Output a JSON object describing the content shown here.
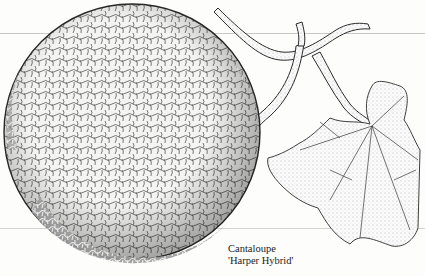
{
  "illustration": {
    "subject": "cantaloupe-with-vine-and-leaf",
    "colors": {
      "ink": "#2a2a2a",
      "paper": "#fdfdfc",
      "rule": "#c8c8c8"
    }
  },
  "caption": {
    "line1": "Cantaloupe",
    "line2": "'Harper Hybrid'"
  }
}
